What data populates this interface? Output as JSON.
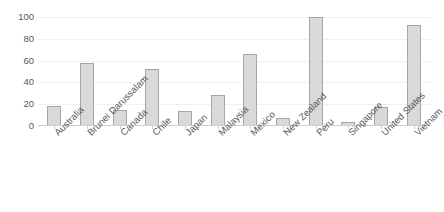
{
  "chart_data": {
    "type": "bar",
    "title": "",
    "subtitle": "",
    "xlabel": "",
    "ylabel": "",
    "ylim": [
      0,
      100
    ],
    "yticks": [
      0,
      20,
      40,
      60,
      80,
      100
    ],
    "grid": true,
    "legend": false,
    "legend_position": "none",
    "categories": [
      "Australia",
      "Brunei Darussalam",
      "Canada",
      "Chile",
      "Japan",
      "Malaysia",
      "Mexico",
      "New Zealand",
      "Peru",
      "Singapore",
      "United States",
      "Vietnam"
    ],
    "values": [
      18,
      58,
      15,
      52,
      14,
      28,
      66,
      7,
      100,
      4,
      17,
      93
    ],
    "series": [
      {
        "name": "",
        "values": [
          18,
          58,
          15,
          52,
          14,
          28,
          66,
          7,
          100,
          4,
          17,
          93
        ]
      }
    ],
    "colors": {
      "bar_fill": "#d9d9d9",
      "bar_border": "#a6a6a6",
      "gridline": "#f0f0f0",
      "axis": "#d0d0d0",
      "text": "#595959",
      "background": "#ffffff"
    }
  }
}
